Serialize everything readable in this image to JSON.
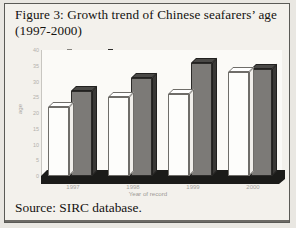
{
  "figure": {
    "title": "Figure 3: Growth trend of Chinese seafarers’ age (1997-2000)",
    "source": "Source: SIRC database."
  },
  "legend": {
    "position": "top-center",
    "items": [
      {
        "label": "Foreign",
        "marker": "hollow-square",
        "color": "#ffffff"
      },
      {
        "label": "National",
        "marker": "filled-square",
        "color": "#2e2d2b"
      }
    ]
  },
  "axes": {
    "x_title": "Year of record",
    "y_title": "age",
    "y_ticks": [
      "40",
      "35",
      "30",
      "25",
      "20",
      "15",
      "10",
      "5",
      "0"
    ]
  },
  "chart_data": {
    "type": "bar",
    "title": "Figure 3: Growth trend of Chinese seafarers’ age (1997-2000)",
    "categories": [
      "1997",
      "1998",
      "1999",
      "2000"
    ],
    "series": [
      {
        "name": "Foreign",
        "values": [
          22,
          25,
          26,
          33
        ],
        "color": "#ffffff"
      },
      {
        "name": "National",
        "values": [
          27,
          31,
          36,
          34
        ],
        "color": "#7c7a77"
      }
    ],
    "xlabel": "Year of record",
    "ylabel": "age",
    "ylim": [
      0,
      40
    ],
    "grid": false,
    "legend_position": "top-center",
    "style": "3d-column"
  }
}
